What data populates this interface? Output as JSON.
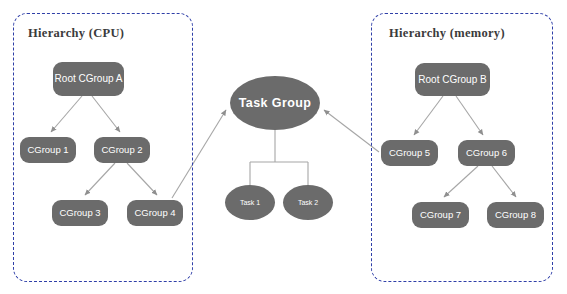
{
  "diagram": {
    "palette": {
      "node_fill": "#6b6b6b",
      "node_text": "#ffffff",
      "box_border": "#2f3fa8",
      "edge": "#a6a6a6",
      "title_text": "#3b3b3b",
      "background": "#ffffff"
    },
    "groups": [
      {
        "name": "hierarchy-cpu",
        "title": "Hierarchy (CPU)",
        "x": 13,
        "y": 13,
        "w": 180,
        "h": 269
      },
      {
        "name": "hierarchy-memory",
        "title": "Hierarchy (memory)",
        "x": 371,
        "y": 13,
        "w": 182,
        "h": 269
      }
    ],
    "nodes": [
      {
        "id": "root-cgroup-a",
        "label": "Root CGroup A",
        "shape": "rounded",
        "style": "n-root",
        "x": 53,
        "y": 62,
        "w": 71,
        "h": 34
      },
      {
        "id": "cgroup-1",
        "label": "CGroup 1",
        "shape": "rounded",
        "style": "n-cgroup",
        "x": 20,
        "y": 137,
        "w": 56,
        "h": 26
      },
      {
        "id": "cgroup-2",
        "label": "CGroup 2",
        "shape": "rounded",
        "style": "n-cgroup",
        "x": 94,
        "y": 137,
        "w": 56,
        "h": 26
      },
      {
        "id": "cgroup-3",
        "label": "CGroup 3",
        "shape": "rounded",
        "style": "n-cgroup",
        "x": 52,
        "y": 200,
        "w": 56,
        "h": 26
      },
      {
        "id": "cgroup-4",
        "label": "CGroup 4",
        "shape": "rounded",
        "style": "n-cgroup",
        "x": 127,
        "y": 200,
        "w": 56,
        "h": 26
      },
      {
        "id": "task-group",
        "label": "Task Group",
        "shape": "ellipse",
        "style": "n-taskgrp",
        "x": 230,
        "y": 76,
        "w": 90,
        "h": 54
      },
      {
        "id": "task-1",
        "label": "Task 1",
        "shape": "ellipse",
        "style": "n-task",
        "x": 225,
        "y": 185,
        "w": 50,
        "h": 35
      },
      {
        "id": "task-2",
        "label": "Task 2",
        "shape": "ellipse",
        "style": "n-task",
        "x": 283,
        "y": 185,
        "w": 50,
        "h": 35
      },
      {
        "id": "root-cgroup-b",
        "label": "Root CGroup B",
        "shape": "rounded",
        "style": "n-root",
        "x": 415,
        "y": 63,
        "w": 75,
        "h": 33
      },
      {
        "id": "cgroup-5",
        "label": "CGroup 5",
        "shape": "rounded",
        "style": "n-cgroup",
        "x": 381,
        "y": 140,
        "w": 57,
        "h": 26
      },
      {
        "id": "cgroup-6",
        "label": "CGroup 6",
        "shape": "rounded",
        "style": "n-cgroup",
        "x": 458,
        "y": 140,
        "w": 57,
        "h": 26
      },
      {
        "id": "cgroup-7",
        "label": "CGroup 7",
        "shape": "rounded",
        "style": "n-cgroup",
        "x": 412,
        "y": 202,
        "w": 57,
        "h": 26
      },
      {
        "id": "cgroup-8",
        "label": "CGroup 8",
        "shape": "rounded",
        "style": "n-cgroup",
        "x": 487,
        "y": 202,
        "w": 57,
        "h": 26
      }
    ],
    "edges": [
      {
        "from": "root-cgroup-a",
        "to": "cgroup-1",
        "arrow": true
      },
      {
        "from": "root-cgroup-a",
        "to": "cgroup-2",
        "arrow": true
      },
      {
        "from": "cgroup-2",
        "to": "cgroup-3",
        "arrow": true
      },
      {
        "from": "cgroup-2",
        "to": "cgroup-4",
        "arrow": true
      },
      {
        "from": "cgroup-4",
        "to": "task-group",
        "arrow": true
      },
      {
        "from": "task-group",
        "to": "task-1",
        "arrow": false
      },
      {
        "from": "task-group",
        "to": "task-2",
        "arrow": false
      },
      {
        "from": "cgroup-5",
        "to": "task-group",
        "arrow": true
      },
      {
        "from": "root-cgroup-b",
        "to": "cgroup-5",
        "arrow": true
      },
      {
        "from": "root-cgroup-b",
        "to": "cgroup-6",
        "arrow": true
      },
      {
        "from": "cgroup-6",
        "to": "cgroup-7",
        "arrow": true
      },
      {
        "from": "cgroup-6",
        "to": "cgroup-8",
        "arrow": true
      }
    ]
  }
}
